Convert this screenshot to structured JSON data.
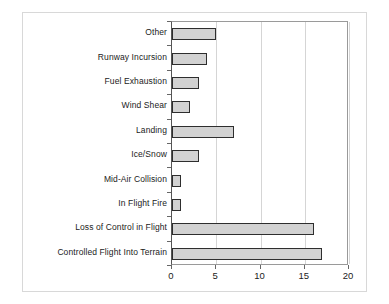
{
  "chart_data": {
    "type": "bar",
    "orientation": "horizontal",
    "title": "",
    "subtitle": "",
    "xlabel": "",
    "ylabel": "",
    "categories": [
      "Controlled Flight Into Terrain",
      "Loss of Control in Flight",
      "In Flight Fire",
      "Mid-Air Collision",
      "Ice/Snow",
      "Landing",
      "Wind Shear",
      "Fuel Exhaustion",
      "Runway Incursion",
      "Other"
    ],
    "values": [
      17,
      16,
      1,
      1,
      3,
      7,
      2,
      3,
      4,
      5
    ],
    "xlim": [
      0,
      20
    ],
    "xticks": [
      0,
      5,
      10,
      15,
      20
    ],
    "xtick_labels": [
      "0",
      "5",
      "10",
      "15",
      "20"
    ],
    "grid": "vertical",
    "legend": "none",
    "bar_fill_color": "#d2d2d2",
    "bar_border_color": "#2e2e2e",
    "gridline_color": "#d5d5d5",
    "plot_border_color": "#9a9a9a",
    "outer_frame_color": "#d8d8d8",
    "background_color": "#ffffff",
    "text_color": "#1b1b1b"
  }
}
